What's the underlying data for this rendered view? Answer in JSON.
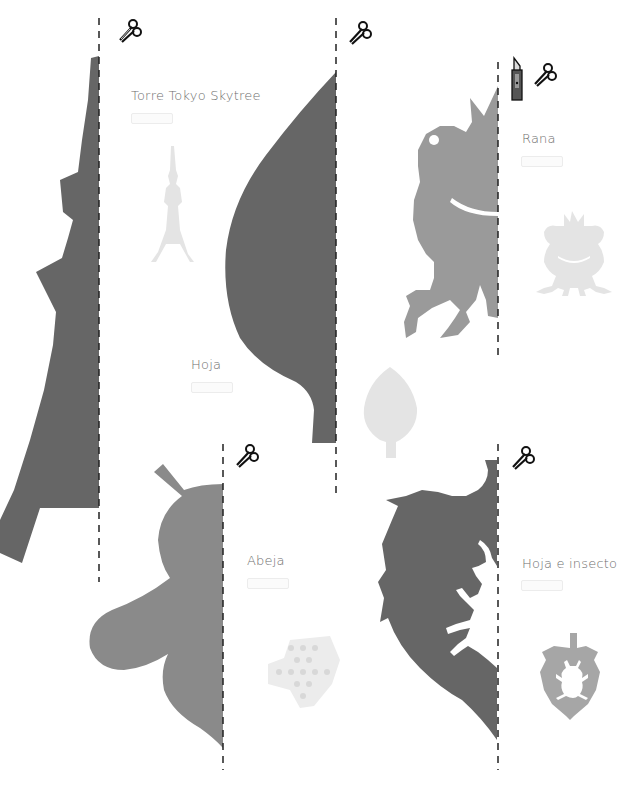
{
  "page": {
    "colors": {
      "background": "#ffffff",
      "dark_shape": "#666666",
      "mid_shape": "#8a8a8a",
      "frog_shape": "#9a9a9a",
      "light_preview": "#e4e4e4",
      "leaf_preview": "#a6a6a6",
      "label_text": "#6e6e6e",
      "cut_line": "#222222"
    }
  },
  "templates": [
    {
      "id": "skytree",
      "title": "Torre Tokyo Skytree",
      "tools": [
        "scissors-icon"
      ]
    },
    {
      "id": "leaf",
      "title": "Hoja",
      "tools": [
        "scissors-icon"
      ]
    },
    {
      "id": "frog",
      "title": "Rana",
      "tools": [
        "cutter-knife-icon",
        "scissors-icon"
      ]
    },
    {
      "id": "bee",
      "title": "Abeja",
      "tools": [
        "scissors-icon"
      ]
    },
    {
      "id": "leaf-insect",
      "title": "Hoja e insecto",
      "tools": [
        "scissors-icon"
      ]
    }
  ]
}
